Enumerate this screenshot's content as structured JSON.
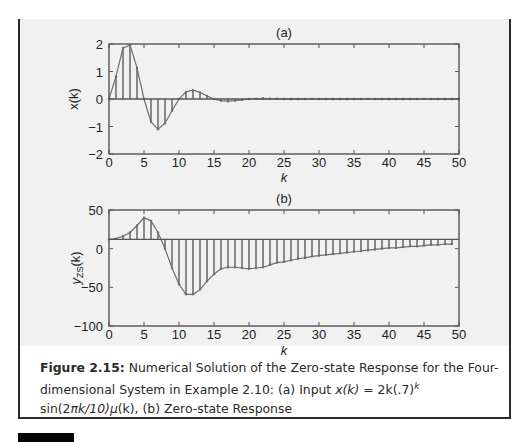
{
  "figure": {
    "label": "Figure 2.15:",
    "caption_line1": "Numerical Solution of the Zero-state Response for the Four-",
    "caption_line2_prefix": "dimensional System in Example 2.10: (a) Input ",
    "caption_formula_x": "x(k)",
    "caption_eq": " = 2k(.7)",
    "caption_sup": "k",
    "caption_line3_sin": "sin(2",
    "caption_line3_pi": "π",
    "caption_line3_rest": "k/10)",
    "caption_line3_mu": "μ",
    "caption_line3_tail": "(k), (b) Zero-state Response"
  },
  "colors": {
    "axis": "#555555",
    "stem": "#6e6e6e",
    "panel": "#f1f1f1",
    "text": "#2a2a2a"
  },
  "chart_data": [
    {
      "type": "stem",
      "title": "(a)",
      "xlabel": "k",
      "ylabel": "x(k)",
      "xlim": [
        0,
        50
      ],
      "ylim": [
        -2,
        2
      ],
      "xticks": [
        0,
        5,
        10,
        15,
        20,
        25,
        30,
        35,
        40,
        45,
        50
      ],
      "yticks": [
        -2,
        -1,
        0,
        1,
        2
      ],
      "baseline": 0,
      "grid": false,
      "x": [
        0,
        1,
        2,
        3,
        4,
        5,
        6,
        7,
        8,
        9,
        10,
        11,
        12,
        13,
        14,
        15,
        16,
        17,
        18,
        19,
        20,
        21,
        22,
        23,
        24,
        25,
        26,
        27,
        28,
        29,
        30,
        31,
        32,
        33,
        34,
        35,
        36,
        37,
        38,
        39,
        40,
        41,
        42,
        43,
        44,
        45,
        46,
        47,
        48,
        49,
        50
      ],
      "values": [
        0,
        0.82,
        1.86,
        1.96,
        1.13,
        0,
        -0.83,
        -1.1,
        -0.88,
        -0.43,
        0,
        0.26,
        0.32,
        0.24,
        0.11,
        0,
        -0.06,
        -0.08,
        -0.06,
        -0.03,
        0,
        0.01,
        0.02,
        0.01,
        0.01,
        0,
        0,
        0,
        0,
        0,
        0,
        0,
        0,
        0,
        0,
        0,
        0,
        0,
        0,
        0,
        0,
        0,
        0,
        0,
        0,
        0,
        0,
        0,
        0,
        0,
        0
      ]
    },
    {
      "type": "stem",
      "title": "(b)",
      "xlabel": "k",
      "ylabel": "y_ZS(k)",
      "ylabel_main": "y",
      "ylabel_sub": "ZS",
      "ylabel_tail": "(k)",
      "xlim": [
        0,
        50
      ],
      "ylim": [
        -100,
        50
      ],
      "xticks": [
        0,
        5,
        10,
        15,
        20,
        25,
        30,
        35,
        40,
        45,
        50
      ],
      "yticks": [
        -100,
        -50,
        0,
        50
      ],
      "baseline": 12,
      "grid": false,
      "x": [
        0,
        1,
        2,
        3,
        4,
        5,
        6,
        7,
        8,
        9,
        10,
        11,
        12,
        13,
        14,
        15,
        16,
        17,
        18,
        19,
        20,
        21,
        22,
        23,
        24,
        25,
        26,
        27,
        28,
        29,
        30,
        31,
        32,
        33,
        34,
        35,
        36,
        37,
        38,
        39,
        40,
        41,
        42,
        43,
        44,
        45,
        46,
        47,
        48,
        49
      ],
      "values": [
        12,
        13,
        16,
        21,
        30,
        40,
        36,
        21,
        0,
        -25,
        -46,
        -59,
        -59,
        -53,
        -42,
        -33,
        -26,
        -24,
        -24,
        -25,
        -26,
        -25,
        -24,
        -21,
        -18,
        -17,
        -15,
        -13,
        -12,
        -10,
        -9,
        -8,
        -7,
        -6,
        -5,
        -4,
        -3,
        -2,
        -1,
        0,
        1,
        1,
        2,
        3,
        3,
        4,
        5,
        5,
        6,
        6
      ]
    }
  ]
}
